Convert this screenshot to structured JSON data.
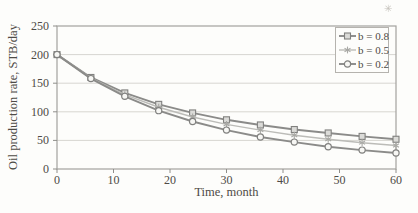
{
  "figure": {
    "artifact_mark": "✳"
  },
  "chart_data": {
    "type": "line",
    "title": "",
    "xlabel": "Time, month",
    "ylabel": "Oil production rate, STB/day",
    "xlim": [
      0,
      60
    ],
    "ylim": [
      0,
      250
    ],
    "xticks": [
      0,
      10,
      20,
      30,
      40,
      50,
      60
    ],
    "yticks": [
      0,
      50,
      100,
      150,
      200,
      250
    ],
    "grid": "horizontal",
    "legend_position": "top-right",
    "x": [
      0,
      6,
      12,
      18,
      24,
      30,
      36,
      42,
      48,
      54,
      60
    ],
    "series": [
      {
        "name": "b = 0.8",
        "marker": "square",
        "line_color": "#8b8b89",
        "marker_fill": "#dbdbd8",
        "marker_stroke": "#81817f",
        "values": [
          200,
          160,
          133,
          113,
          98,
          86,
          77,
          69,
          63,
          57,
          52
        ]
      },
      {
        "name": "b = 0.5",
        "marker": "asterisk",
        "line_color": "#bcbcb8",
        "marker_fill": "#bcbcb8",
        "marker_stroke": "#a9a9a5",
        "values": [
          200,
          159,
          130,
          108,
          91,
          78,
          68,
          59,
          52,
          46,
          41
        ]
      },
      {
        "name": "b = 0.2",
        "marker": "circle",
        "line_color": "#8b8b89",
        "marker_fill": "#f7f7f4",
        "marker_stroke": "#81817f",
        "values": [
          200,
          158,
          127,
          102,
          83,
          68,
          56,
          47,
          39,
          33,
          28
        ]
      }
    ],
    "axis_color": "#a3a29e",
    "grid_color": "#d7d6d1",
    "tick_color": "#8f8e8a",
    "text_color": "#4e4b46"
  }
}
